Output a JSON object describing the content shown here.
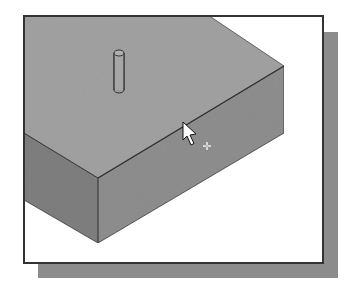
{
  "figure": {
    "colors": {
      "background": "#ffffff",
      "frame_border": "#333333",
      "drop_shadow": "#8c8c8c",
      "top_face": "#a2a2a2",
      "front_face": "#8f8f8f",
      "left_face": "#7f7f7f",
      "edge_line": "#3a3a3a"
    },
    "box": {
      "top_face_points": "24,15 208,15 284,66 98,178 24,133",
      "front_face_points": "98,178 284,66 284,133 98,243",
      "left_face_points": "24,133 98,178 98,243 24,200"
    },
    "cylinder": {
      "top_cx": 119,
      "top_cy": 53,
      "bottom_cx": 119,
      "bottom_cy": 90,
      "rx": 5,
      "ry": 3
    },
    "cursor": {
      "type": "arrow-pointer",
      "tip_x": 183,
      "tip_y": 122,
      "crosshair_x": 207,
      "crosshair_y": 146
    }
  }
}
